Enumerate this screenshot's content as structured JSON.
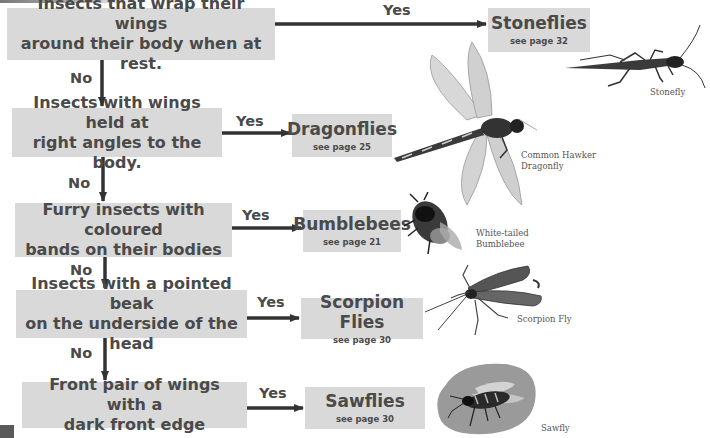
{
  "diagram": {
    "type": "flowchart-key",
    "colors": {
      "box_fill": "#d9d9d9",
      "text": "#4a4a4a",
      "arrow": "#333333"
    },
    "questions": [
      {
        "text_line1": "Insects that wrap their wings",
        "text_line2": "around their body when at rest."
      },
      {
        "text_line1": "Insects with wings held at",
        "text_line2": "right angles to the body."
      },
      {
        "text_line1": "Furry insects with coloured",
        "text_line2": "bands on their bodies"
      },
      {
        "text_line1": "Insects with a pointed beak",
        "text_line2": "on the underside of the head"
      },
      {
        "text_line1": "Front pair of wings with a",
        "text_line2": "dark front edge"
      }
    ],
    "answers": [
      {
        "title": "Stoneflies",
        "page": "see page 32"
      },
      {
        "title": "Dragonflies",
        "page": "see page 25"
      },
      {
        "title": "Bumblebees",
        "page": "see page 21"
      },
      {
        "title": "Scorpion Flies",
        "page": "see page 30"
      },
      {
        "title": "Sawflies",
        "page": "see page 30"
      }
    ],
    "yes_label": "Yes",
    "no_label": "No",
    "illustrations": [
      {
        "name": "stonefly-illustration",
        "caption_line1": "Stonefly",
        "caption_line2": ""
      },
      {
        "name": "dragonfly-illustration",
        "caption_line1": "Common Hawker",
        "caption_line2": "Dragonfly"
      },
      {
        "name": "bumblebee-illustration",
        "caption_line1": "White-tailed",
        "caption_line2": "Bumblebee"
      },
      {
        "name": "scorpion-fly-illustration",
        "caption_line1": "Scorpion Fly",
        "caption_line2": ""
      },
      {
        "name": "sawfly-illustration",
        "caption_line1": "Sawfly",
        "caption_line2": ""
      }
    ]
  }
}
